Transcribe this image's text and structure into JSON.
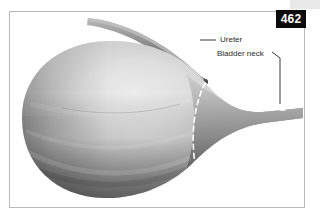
{
  "figure": {
    "page_number": "462",
    "frame_color": "#b9b9b9",
    "background_color": "#ffffff",
    "badge_background": "#0b0b0b",
    "badge_text_color": "#ffffff"
  },
  "illustration": {
    "subject": "urinary bladder with ureter and bladder neck",
    "style": "grayscale airbrush anatomical drawing",
    "bladder_fill_light": "#e6e6e6",
    "bladder_fill_mid": "#9a9a9a",
    "bladder_fill_dark": "#5b5b5b",
    "ureter_fill_light": "#a8a8a8",
    "ureter_fill_dark": "#4f4f4f",
    "dashed_line_color": "#ffffff",
    "leader_line_color": "#3a3a3a"
  },
  "callouts": [
    {
      "id": "ureter",
      "label": "Ureter",
      "leader": "horizontal-dash-left"
    },
    {
      "id": "bladder-neck",
      "label": "Bladder neck",
      "leader": "angled-then-vertical-down"
    }
  ]
}
